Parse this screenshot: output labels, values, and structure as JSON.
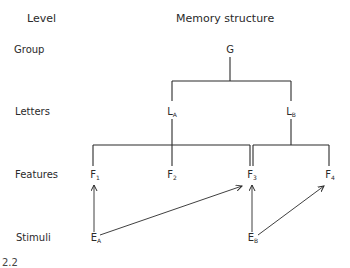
{
  "headers": {
    "level": "Level",
    "structure": "Memory structure"
  },
  "levels": [
    {
      "id": "group",
      "label": "Group",
      "y": 44
    },
    {
      "id": "letters",
      "label": "Letters",
      "y": 106
    },
    {
      "id": "features",
      "label": "Features",
      "y": 169
    },
    {
      "id": "stimuli",
      "label": "Stimuli",
      "y": 232
    }
  ],
  "nodes": [
    {
      "id": "G",
      "base": "G",
      "sub": "",
      "x": 230,
      "y": 44
    },
    {
      "id": "LA",
      "base": "L",
      "sub": "A",
      "x": 172,
      "y": 106
    },
    {
      "id": "LB",
      "base": "L",
      "sub": "B",
      "x": 291,
      "y": 106
    },
    {
      "id": "F1",
      "base": "F",
      "sub": "1",
      "x": 95,
      "y": 169
    },
    {
      "id": "F2",
      "base": "F",
      "sub": "2",
      "x": 172,
      "y": 169
    },
    {
      "id": "F3",
      "base": "F",
      "sub": "3",
      "x": 252,
      "y": 169
    },
    {
      "id": "F4",
      "base": "F",
      "sub": "4",
      "x": 330,
      "y": 169
    },
    {
      "id": "EA",
      "base": "E",
      "sub": "A",
      "x": 96,
      "y": 232
    },
    {
      "id": "EB",
      "base": "E",
      "sub": "B",
      "x": 253,
      "y": 232
    }
  ],
  "connections": {
    "tree_lines": [
      [
        230,
        57,
        230,
        81
      ],
      [
        172,
        81,
        291,
        81
      ],
      [
        172,
        81,
        172,
        101
      ],
      [
        291,
        81,
        291,
        101
      ],
      [
        172,
        119,
        172,
        166
      ],
      [
        291,
        119,
        291,
        145
      ],
      [
        93,
        145,
        250,
        145
      ],
      [
        93,
        145,
        93,
        166
      ],
      [
        250,
        145,
        250,
        166
      ],
      [
        253,
        145,
        329,
        145
      ],
      [
        253,
        145,
        253,
        166
      ],
      [
        329,
        145,
        329,
        166
      ]
    ],
    "arrows": [
      {
        "from": "EA",
        "to": "F1",
        "coords": [
          94,
          232,
          94,
          185
        ]
      },
      {
        "from": "EA",
        "to": "F3",
        "coords": [
          100,
          235,
          242,
          186
        ]
      },
      {
        "from": "EB",
        "to": "F3",
        "coords": [
          252,
          232,
          252,
          185
        ]
      },
      {
        "from": "EB",
        "to": "F4",
        "coords": [
          258,
          235,
          324,
          186
        ]
      }
    ]
  },
  "figure_number_fragment": "2.2"
}
